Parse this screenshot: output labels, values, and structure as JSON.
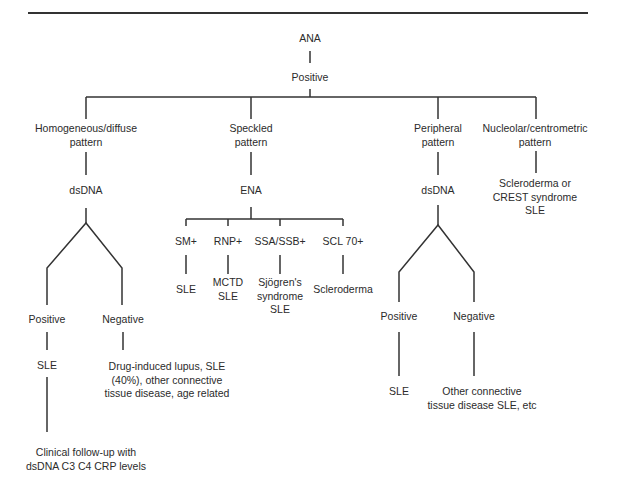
{
  "diagram": {
    "root": "ANA",
    "root_result": "Positive",
    "patterns": [
      {
        "label": "Homogeneous/diffuse\npattern",
        "test": "dsDNA",
        "positive": "Positive",
        "negative": "Negative",
        "positive_outcome": "SLE",
        "negative_outcome": "Drug-induced lupus, SLE\n(40%), other connective\ntissue disease, age related",
        "follow_up": "Clinical follow-up with\ndsDNA C3 C4 CRP levels"
      },
      {
        "label": "Speckled\npattern",
        "test": "ENA",
        "antibodies": [
          {
            "label": "SM+",
            "outcome": "SLE"
          },
          {
            "label": "RNP+",
            "outcome": "MCTD\nSLE"
          },
          {
            "label": "SSA/SSB+",
            "outcome": "Sjögren's\nsyndrome\nSLE"
          },
          {
            "label": "SCL 70+",
            "outcome": "Scleroderma"
          }
        ]
      },
      {
        "label": "Peripheral\npattern",
        "test": "dsDNA",
        "positive": "Positive",
        "negative": "Negative",
        "positive_outcome": "SLE",
        "negative_outcome": "Other connective\ntissue disease SLE, etc"
      },
      {
        "label": "Nucleolar/centrometric\npattern",
        "outcome": "Scleroderma or\nCREST syndrome\nSLE"
      }
    ]
  }
}
